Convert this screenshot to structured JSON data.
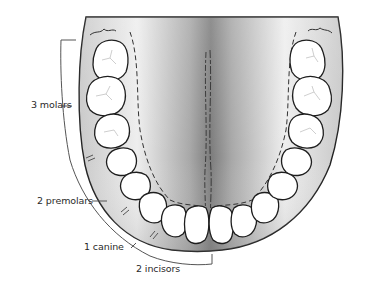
{
  "diagram": {
    "labels": {
      "molars": "3 molars",
      "premolars": "2 premolars",
      "canine": "1 canine",
      "incisors": "2 incisors"
    },
    "colors": {
      "background": "#ffffff",
      "tooth_fill": "#ffffff",
      "outline": "#222222",
      "gum": "#a9a9a9",
      "palate_dark": "#8a8a8a",
      "palate_light": "#efefef",
      "bracket": "#555555"
    },
    "tooth_groups_per_side": [
      {
        "name": "molars",
        "count": 3
      },
      {
        "name": "premolars",
        "count": 2
      },
      {
        "name": "canine",
        "count": 1
      },
      {
        "name": "incisors",
        "count": 2
      }
    ]
  }
}
